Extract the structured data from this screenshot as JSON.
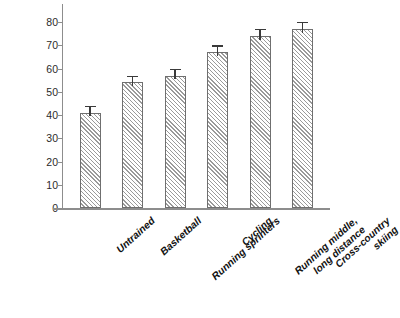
{
  "chart_data": {
    "type": "bar",
    "title": "",
    "xlabel": "",
    "ylabel": "VO2 max (mL/kg/min)",
    "ylabel_parts": {
      "v_with_dot": "V",
      "subscript": "2",
      "rest": " max (mL/kg/min)"
    },
    "categories": [
      "Untrained",
      "Running sprinters",
      "Basketball",
      "Cycling",
      "Running middle,\nlong distance",
      "Cross-country\nskiing"
    ],
    "category_order": [
      "Untrained",
      "Basketball",
      "Running sprinters",
      "Cycling",
      "Running middle,\nlong distance",
      "Cross-country\nskiing"
    ],
    "values": [
      41,
      54,
      57,
      67,
      74,
      77
    ],
    "errors": [
      3,
      3,
      3,
      3,
      3,
      3
    ],
    "ylim": [
      0,
      80
    ],
    "ytick_values": [
      0,
      10,
      20,
      30,
      40,
      50,
      60,
      70,
      80
    ],
    "ytick_labels": [
      "0",
      "10",
      "20",
      "30",
      "40",
      "50",
      "60",
      "70",
      "80"
    ],
    "grid": false,
    "legend": null,
    "bar_fill": "diagonal-hatch",
    "colors": {
      "bar_edge": "#6f6f6f",
      "bar_hatch": "#9a9a9a",
      "bar_face": "#ffffff",
      "axis": "#8d8d8d",
      "error_bar": "#3a3a3a",
      "text": "#121212",
      "background": "#ffffff"
    }
  }
}
